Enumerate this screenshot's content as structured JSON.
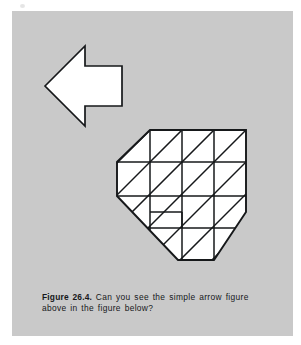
{
  "page": {
    "background_color": "#ffffff",
    "panel_color": "#c9c9c9",
    "ink_color": "#16181a",
    "shape_fill": "#ffffff"
  },
  "caption": {
    "figure_label": "Figure 26.4.",
    "text": "Can you see the simple arrow figure above in the figure below?",
    "full_text": "Figure 26.4. Can you see the simple arrow figure above in the figure below?"
  },
  "figures": {
    "arrow": {
      "name": "simple-arrow-figure",
      "direction": "left",
      "fill": "#ffffff",
      "stroke": "#16181a",
      "stroke_width": 1.6,
      "points": "45,86 85,46 85,66 122,66 122,106 85,106 85,126"
    },
    "hidden_figure": {
      "name": "complex-hexagon-figure",
      "description": "octagonal grid of squares crossed by parallel diagonal lines",
      "fill": "#ffffff",
      "stroke": "#16181a",
      "outline_points": "150,130 246,130 246,212 214,260 178,260 117,196 117,162",
      "cell_size": 32,
      "diagonal_spacing": 16
    }
  }
}
